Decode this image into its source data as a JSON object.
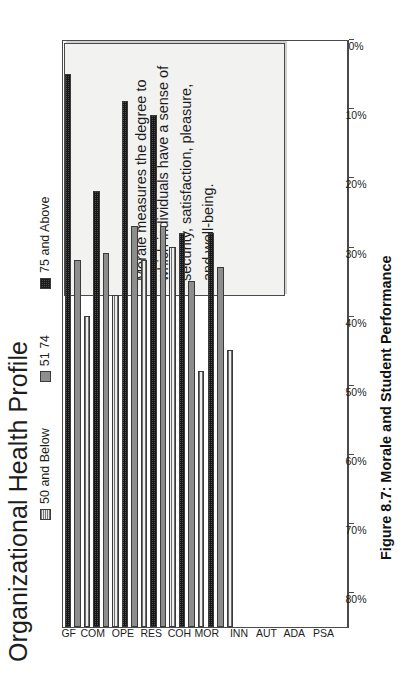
{
  "figure": {
    "title": "Organizational Health Profile",
    "caption": "Figure 8.7:  Morale and Student Performance",
    "annotation": "Morale measures the degree to which individuals have a sense of security, satisfaction, pleasure, and well-being."
  },
  "legend": {
    "items": [
      {
        "label": "50 and Below",
        "swatch": "light-hatch-swatch"
      },
      {
        "label": "51 74",
        "swatch": "mid-gray-swatch"
      },
      {
        "label": "75 and Above",
        "swatch": "dark-checker-swatch"
      }
    ]
  },
  "axis": {
    "tick_labels": [
      "80%",
      "70%",
      "60%",
      "50%",
      "40%",
      "30%",
      "20%",
      "10%",
      "0%"
    ]
  },
  "chart_data": {
    "type": "bar",
    "title": "Organizational Health Profile",
    "xlabel": "",
    "ylabel": "",
    "ylim": [
      0,
      85
    ],
    "grid": false,
    "legend_position": "top",
    "orientation": "vertical-rotated",
    "categories": [
      "GF",
      "COM",
      "OPE",
      "RES",
      "COH",
      "MOR",
      "INN",
      "AUT",
      "ADA",
      "PSA"
    ],
    "series": [
      {
        "name": "50 and Below",
        "values": [
          45,
          48,
          53,
          55,
          37,
          40,
          null,
          null,
          null,
          null
        ]
      },
      {
        "name": "51 74",
        "values": [
          53,
          54,
          58,
          58,
          50,
          52,
          null,
          null,
          null,
          null
        ]
      },
      {
        "name": "75 and Above",
        "values": [
          80,
          63,
          76,
          74,
          57,
          57,
          null,
          null,
          null,
          null
        ]
      }
    ],
    "annotations": [
      {
        "text": "Morale measures the degree to which individuals have a sense of security, satisfaction, pleasure, and well-being.",
        "anchor": "INN-PSA"
      }
    ]
  }
}
